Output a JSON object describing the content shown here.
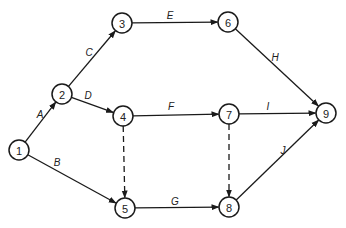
{
  "diagram": {
    "type": "activity-on-arrow network",
    "colors": {
      "line": "#1a1a1a",
      "node_fill": "#ffffff",
      "text": "#222222",
      "background": "#ffffff"
    },
    "node_radius": 10,
    "nodes": [
      {
        "id": "1",
        "label": "1",
        "x": 19,
        "y": 150
      },
      {
        "id": "2",
        "label": "2",
        "x": 62,
        "y": 94
      },
      {
        "id": "3",
        "label": "3",
        "x": 122,
        "y": 23
      },
      {
        "id": "4",
        "label": "4",
        "x": 123,
        "y": 116
      },
      {
        "id": "5",
        "label": "5",
        "x": 125,
        "y": 208
      },
      {
        "id": "6",
        "label": "6",
        "x": 228,
        "y": 22
      },
      {
        "id": "7",
        "label": "7",
        "x": 229,
        "y": 114
      },
      {
        "id": "8",
        "label": "8",
        "x": 229,
        "y": 207
      },
      {
        "id": "9",
        "label": "9",
        "x": 326,
        "y": 113
      }
    ],
    "edges": [
      {
        "from": "1",
        "to": "2",
        "label": "A",
        "dashed": false,
        "lx": 40,
        "ly": 114
      },
      {
        "from": "1",
        "to": "5",
        "label": "B",
        "dashed": false,
        "lx": 57,
        "ly": 162
      },
      {
        "from": "2",
        "to": "3",
        "label": "C",
        "dashed": false,
        "lx": 89,
        "ly": 52
      },
      {
        "from": "2",
        "to": "4",
        "label": "D",
        "dashed": false,
        "lx": 88,
        "ly": 95
      },
      {
        "from": "3",
        "to": "6",
        "label": "E",
        "dashed": false,
        "lx": 170,
        "ly": 15
      },
      {
        "from": "4",
        "to": "7",
        "label": "F",
        "dashed": false,
        "lx": 171,
        "ly": 106
      },
      {
        "from": "5",
        "to": "8",
        "label": "G",
        "dashed": false,
        "lx": 175,
        "ly": 201
      },
      {
        "from": "6",
        "to": "9",
        "label": "H",
        "dashed": false,
        "lx": 275,
        "ly": 57
      },
      {
        "from": "7",
        "to": "9",
        "label": "I",
        "dashed": false,
        "lx": 268,
        "ly": 106
      },
      {
        "from": "8",
        "to": "9",
        "label": "J",
        "dashed": false,
        "lx": 283,
        "ly": 150
      },
      {
        "from": "4",
        "to": "5",
        "label": "",
        "dashed": true
      },
      {
        "from": "7",
        "to": "8",
        "label": "",
        "dashed": true
      }
    ]
  }
}
